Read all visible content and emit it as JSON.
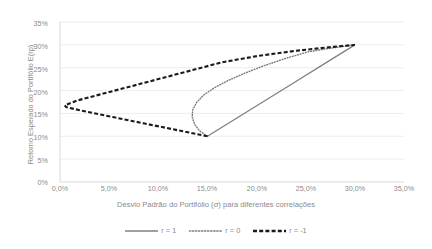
{
  "chart_data": {
    "type": "line",
    "title": "",
    "xlabel": "Desvio Padrão do Portifólio (σ) para diferentes correlações",
    "ylabel": "Retorno Esperado do Portifólio E(rp)",
    "xlim": [
      0,
      35
    ],
    "ylim": [
      0,
      35
    ],
    "xticks": [
      "0,0%",
      "5,0%",
      "10,0%",
      "15,0%",
      "20,0%",
      "25,0%",
      "30,0%",
      "35,0%"
    ],
    "xtick_values": [
      0,
      5,
      10,
      15,
      20,
      25,
      30,
      35
    ],
    "yticks": [
      "0%",
      "5%",
      "10%",
      "15%",
      "20%",
      "25%",
      "30%",
      "35%"
    ],
    "ytick_values": [
      0,
      5,
      10,
      15,
      20,
      25,
      30,
      35
    ],
    "grid": "horizontal",
    "legend_position": "bottom",
    "series": [
      {
        "name": "r = 1",
        "style": "solid",
        "color": "#808080",
        "points": [
          {
            "x": 15.0,
            "y": 10.0
          },
          {
            "x": 18.0,
            "y": 14.0
          },
          {
            "x": 21.0,
            "y": 18.0
          },
          {
            "x": 24.0,
            "y": 22.0
          },
          {
            "x": 27.0,
            "y": 26.0
          },
          {
            "x": 30.0,
            "y": 30.0
          }
        ]
      },
      {
        "name": "r = 0",
        "style": "dotted",
        "color": "#7a7a7a",
        "points": [
          {
            "x": 15.0,
            "y": 10.0
          },
          {
            "x": 14.2,
            "y": 11.2
          },
          {
            "x": 13.7,
            "y": 12.6
          },
          {
            "x": 13.45,
            "y": 14.2
          },
          {
            "x": 13.5,
            "y": 15.8
          },
          {
            "x": 13.9,
            "y": 17.4
          },
          {
            "x": 14.6,
            "y": 19.0
          },
          {
            "x": 15.7,
            "y": 20.6
          },
          {
            "x": 17.1,
            "y": 22.2
          },
          {
            "x": 18.8,
            "y": 23.8
          },
          {
            "x": 20.7,
            "y": 25.4
          },
          {
            "x": 22.9,
            "y": 27.0
          },
          {
            "x": 25.3,
            "y": 28.5
          },
          {
            "x": 27.6,
            "y": 29.3
          },
          {
            "x": 30.0,
            "y": 30.0
          }
        ]
      },
      {
        "name": "r = -1",
        "style": "dashed",
        "color": "#1a1a1a",
        "points": [
          {
            "x": 15.0,
            "y": 10.0
          },
          {
            "x": 11.8,
            "y": 11.4
          },
          {
            "x": 8.6,
            "y": 12.8
          },
          {
            "x": 5.4,
            "y": 14.2
          },
          {
            "x": 2.2,
            "y": 15.6
          },
          {
            "x": 0.6,
            "y": 16.4
          },
          {
            "x": 0.5,
            "y": 16.8
          },
          {
            "x": 1.7,
            "y": 17.8
          },
          {
            "x": 5.4,
            "y": 19.9
          },
          {
            "x": 9.1,
            "y": 22.0
          },
          {
            "x": 12.8,
            "y": 24.1
          },
          {
            "x": 16.5,
            "y": 26.2
          },
          {
            "x": 20.2,
            "y": 27.6
          },
          {
            "x": 24.0,
            "y": 28.7
          },
          {
            "x": 27.0,
            "y": 29.4
          },
          {
            "x": 30.0,
            "y": 30.0
          }
        ]
      }
    ]
  },
  "legend": {
    "items": [
      {
        "label": "r = 1"
      },
      {
        "label": "r = 0"
      },
      {
        "label": "r = -1"
      }
    ]
  }
}
